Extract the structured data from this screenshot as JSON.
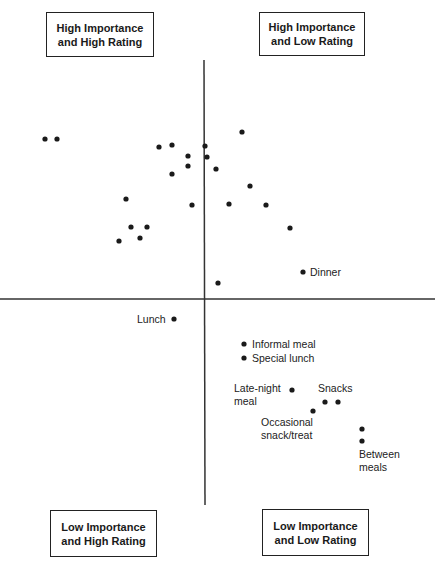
{
  "chart_data": {
    "type": "scatter",
    "title": "",
    "xlabel": "",
    "ylabel": "",
    "grid": false,
    "axes": {
      "vertical_x": 204,
      "horizontal_y": 299
    },
    "quadrants": [
      {
        "position": "top-left",
        "label": "High Importance\nand High Rating"
      },
      {
        "position": "top-right",
        "label": "High Importance\nand Low Rating"
      },
      {
        "position": "bottom-left",
        "label": "Low Importance\nand High Rating"
      },
      {
        "position": "bottom-right",
        "label": "Low Importance\nand Low Rating"
      }
    ],
    "points": [
      {
        "x": 45,
        "y": 139,
        "label": ""
      },
      {
        "x": 57,
        "y": 139,
        "label": ""
      },
      {
        "x": 159,
        "y": 147,
        "label": ""
      },
      {
        "x": 172,
        "y": 145,
        "label": ""
      },
      {
        "x": 205,
        "y": 146,
        "label": ""
      },
      {
        "x": 242,
        "y": 132,
        "label": ""
      },
      {
        "x": 188,
        "y": 156,
        "label": ""
      },
      {
        "x": 207,
        "y": 157,
        "label": ""
      },
      {
        "x": 188,
        "y": 166,
        "label": ""
      },
      {
        "x": 216,
        "y": 169,
        "label": ""
      },
      {
        "x": 172,
        "y": 174,
        "label": ""
      },
      {
        "x": 250,
        "y": 186,
        "label": ""
      },
      {
        "x": 126,
        "y": 199,
        "label": ""
      },
      {
        "x": 192,
        "y": 205,
        "label": ""
      },
      {
        "x": 229,
        "y": 204,
        "label": ""
      },
      {
        "x": 266,
        "y": 205,
        "label": ""
      },
      {
        "x": 131,
        "y": 227,
        "label": ""
      },
      {
        "x": 147,
        "y": 227,
        "label": ""
      },
      {
        "x": 290,
        "y": 228,
        "label": ""
      },
      {
        "x": 140,
        "y": 238,
        "label": ""
      },
      {
        "x": 119,
        "y": 241,
        "label": ""
      },
      {
        "x": 303,
        "y": 272,
        "label": "Dinner"
      },
      {
        "x": 218,
        "y": 283,
        "label": ""
      },
      {
        "x": 174,
        "y": 319,
        "label": "Lunch"
      },
      {
        "x": 244,
        "y": 344,
        "label": "Informal meal"
      },
      {
        "x": 244,
        "y": 358,
        "label": "Special lunch"
      },
      {
        "x": 292,
        "y": 390,
        "label": "Late-night meal"
      },
      {
        "x": 325,
        "y": 402,
        "label": "Snacks"
      },
      {
        "x": 338,
        "y": 402,
        "label": ""
      },
      {
        "x": 313,
        "y": 411,
        "label": "Occasional snack/treat"
      },
      {
        "x": 362,
        "y": 429,
        "label": ""
      },
      {
        "x": 362,
        "y": 441,
        "label": "Between meals"
      }
    ]
  },
  "quadrant_labels": {
    "top_left": "High Importance\nand High Rating",
    "top_right": "High Importance\nand Low Rating",
    "bottom_left": "Low Importance\nand High Rating",
    "bottom_right": "Low Importance\nand Low Rating"
  },
  "point_labels": {
    "dinner": "Dinner",
    "lunch": "Lunch",
    "informal_meal": "Informal meal",
    "special_lunch": "Special lunch",
    "late_night_1": "Late-night",
    "late_night_2": "meal",
    "snacks": "Snacks",
    "occasional_1": "Occasional",
    "occasional_2": "snack/treat",
    "between_1": "Between",
    "between_2": "meals"
  }
}
